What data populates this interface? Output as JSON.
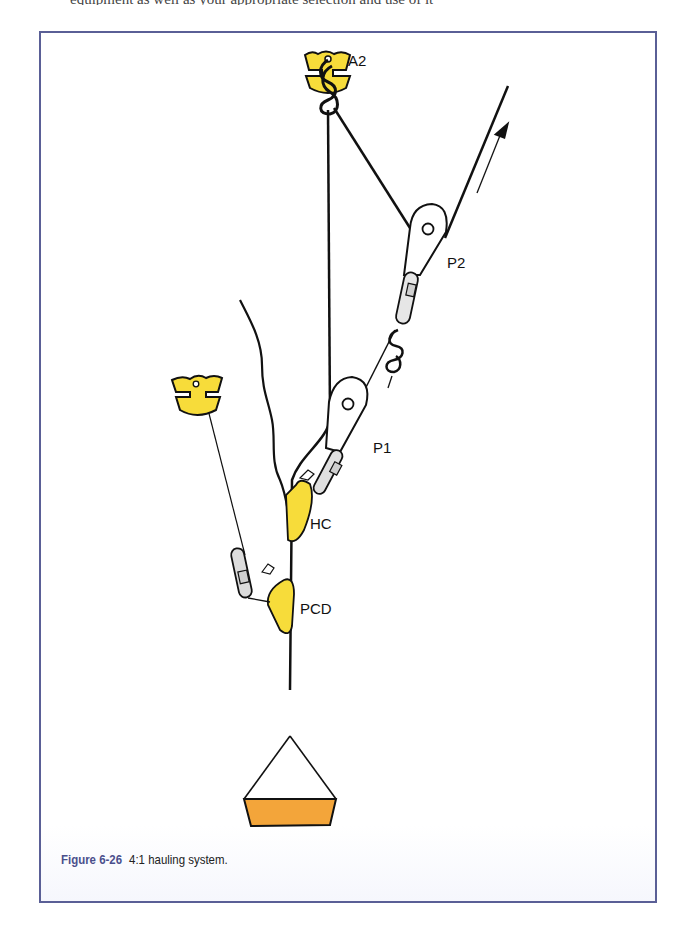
{
  "page": {
    "cut_text_top": "equipment as well as your appropriate selection and use of it"
  },
  "figure": {
    "number": "Figure 6-26",
    "caption": "4:1 hauling system.",
    "colors": {
      "frame": "#5a5f96",
      "anchor_yellow": "#f7dc3a",
      "load_orange": "#f3a53a",
      "rope": "#111111",
      "carabiner": "#d8d8d8"
    },
    "labels": {
      "anchor_top": "A2",
      "pulley_top": "P2",
      "pulley_bottom": "P1",
      "haul_cam": "HC",
      "progress_capture": "PCD"
    },
    "components": [
      {
        "id": "A2",
        "type": "anchor",
        "desc": "top anchor with figure-8 knot"
      },
      {
        "id": "P2",
        "type": "pulley",
        "desc": "upper pulley with locking carabiner"
      },
      {
        "id": "P1",
        "type": "pulley",
        "desc": "lower pulley with locking carabiner"
      },
      {
        "id": "HC",
        "type": "rope-grab",
        "desc": "haul cam"
      },
      {
        "id": "PCD",
        "type": "rope-grab",
        "desc": "progress capture device"
      },
      {
        "id": "anchor-left",
        "type": "anchor",
        "desc": "secondary anchor tethered to PCD"
      },
      {
        "id": "load",
        "type": "load",
        "desc": "haul bag / load"
      }
    ],
    "haul_direction": "up-right (arrow)"
  }
}
